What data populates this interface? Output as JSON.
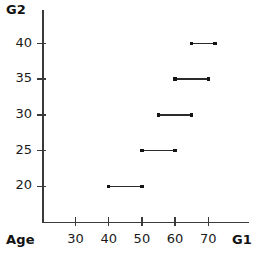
{
  "chart_data": {
    "type": "line",
    "title": "",
    "subtitle": "",
    "xlabel": "G1",
    "ylabel": "G2",
    "corner_label": "Age",
    "xlim": [
      20,
      75
    ],
    "ylim": [
      15,
      43
    ],
    "xticks": [
      30,
      40,
      50,
      60,
      70
    ],
    "yticks": [
      20,
      25,
      30,
      35,
      40
    ],
    "xtick_labels": [
      "30",
      "40",
      "50",
      "60",
      "70"
    ],
    "ytick_labels": [
      "20",
      "25",
      "30",
      "35",
      "40"
    ],
    "grid": false,
    "legend": false,
    "legend_position": "none",
    "series": [
      {
        "name": "step-segments",
        "style": "horizontal-segments-with-endpoint-dots",
        "color": "#2b2b2b",
        "segments": [
          {
            "y": 20,
            "x_start": 40,
            "x_end": 50
          },
          {
            "y": 25,
            "x_start": 50,
            "x_end": 60
          },
          {
            "y": 30,
            "x_start": 55,
            "x_end": 65
          },
          {
            "y": 35,
            "x_start": 60,
            "x_end": 70
          },
          {
            "y": 40,
            "x_start": 65,
            "x_end": 72
          }
        ]
      }
    ],
    "annotations": []
  },
  "labels": {
    "y_axis_title": "G2",
    "x_axis_title": "G1",
    "origin_label": "Age"
  },
  "colors": {
    "axis": "#3a3a3a",
    "data": "#2b2b2b",
    "text": "#1a1a1a",
    "background": "#ffffff"
  }
}
